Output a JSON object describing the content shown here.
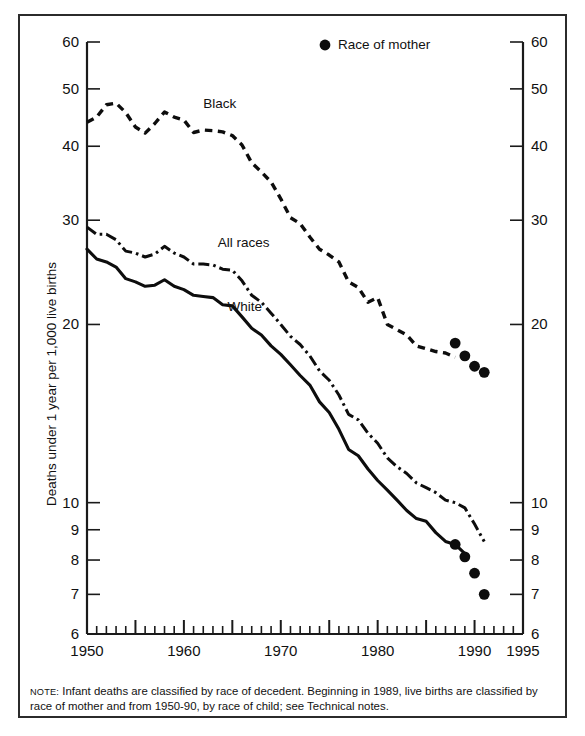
{
  "figure": {
    "note_label": "NOTE:",
    "note_text": "Infant deaths are classified by race of decedent. Beginning in 1989, live births are classified by race of mother and from 1950-90, by race of child; see Technical notes."
  },
  "legend": {
    "marker_label": "Race of mother"
  },
  "series_labels": {
    "black": "Black",
    "all_races": "All races",
    "white": "White"
  },
  "chart_data": {
    "type": "line",
    "title": "",
    "xlabel": "",
    "ylabel": "Deaths under 1 year per 1,000 live births",
    "yscale": "log",
    "ylim": [
      6,
      60
    ],
    "xlim": [
      1950,
      1995
    ],
    "grid": false,
    "legend_position": "top-center",
    "y_ticks": [
      6,
      7,
      8,
      9,
      10,
      20,
      30,
      40,
      50,
      60
    ],
    "y_tick_labels": [
      "6",
      "7",
      "8",
      "9",
      "10",
      "20",
      "30",
      "40",
      "50",
      "60"
    ],
    "x_ticks_major": [
      1950,
      1955,
      1960,
      1965,
      1970,
      1975,
      1980,
      1985,
      1990,
      1995
    ],
    "x_tick_labels": [
      {
        "x": 1950,
        "label": "1950"
      },
      {
        "x": 1960,
        "label": "1960"
      },
      {
        "x": 1970,
        "label": "1970"
      },
      {
        "x": 1980,
        "label": "1980"
      },
      {
        "x": 1990,
        "label": "1990"
      },
      {
        "x": 1995,
        "label": "1995"
      }
    ],
    "x_tick_minor_step": 1,
    "series": [
      {
        "name": "Black",
        "style": "dashed",
        "label_at": {
          "x": 1962.0,
          "y": 46.5
        },
        "x": [
          1950,
          1951,
          1952,
          1953,
          1954,
          1955,
          1956,
          1957,
          1958,
          1959,
          1960,
          1961,
          1962,
          1963,
          1964,
          1965,
          1966,
          1967,
          1968,
          1969,
          1970,
          1971,
          1972,
          1973,
          1974,
          1975,
          1976,
          1977,
          1978,
          1979,
          1980,
          1981,
          1982,
          1983,
          1984,
          1985,
          1986,
          1987,
          1988
        ],
        "values": [
          43.9,
          44.8,
          47.0,
          47.3,
          45.6,
          43.1,
          42.1,
          43.7,
          45.7,
          44.8,
          44.3,
          42.2,
          42.6,
          42.5,
          42.3,
          41.7,
          40.2,
          37.5,
          36.2,
          34.8,
          32.6,
          30.3,
          29.6,
          28.1,
          26.8,
          26.2,
          25.5,
          23.6,
          23.1,
          21.8,
          22.2,
          20.0,
          19.6,
          19.2,
          18.4,
          18.2,
          18.0,
          17.9,
          17.6
        ]
      },
      {
        "name": "All races",
        "style": "dash-dot",
        "label_at": {
          "x": 1963.5,
          "y": 27.0
        },
        "x": [
          1950,
          1951,
          1952,
          1953,
          1954,
          1955,
          1956,
          1957,
          1958,
          1959,
          1960,
          1961,
          1962,
          1963,
          1964,
          1965,
          1966,
          1967,
          1968,
          1969,
          1970,
          1971,
          1972,
          1973,
          1974,
          1975,
          1976,
          1977,
          1978,
          1979,
          1980,
          1981,
          1982,
          1983,
          1984,
          1985,
          1986,
          1987,
          1988,
          1989,
          1990,
          1991
        ],
        "values": [
          29.2,
          28.4,
          28.4,
          27.8,
          26.6,
          26.4,
          26.0,
          26.3,
          27.1,
          26.4,
          26.0,
          25.3,
          25.3,
          25.2,
          24.8,
          24.7,
          23.7,
          22.4,
          21.8,
          20.9,
          20.0,
          19.1,
          18.5,
          17.7,
          16.7,
          16.1,
          15.2,
          14.1,
          13.8,
          13.1,
          12.6,
          11.9,
          11.5,
          11.2,
          10.8,
          10.6,
          10.4,
          10.1,
          10.0,
          9.8,
          9.2,
          8.6
        ]
      },
      {
        "name": "White",
        "style": "solid",
        "label_at": {
          "x": 1964.5,
          "y": 21.1
        },
        "x": [
          1950,
          1951,
          1952,
          1953,
          1954,
          1955,
          1956,
          1957,
          1958,
          1959,
          1960,
          1961,
          1962,
          1963,
          1964,
          1965,
          1966,
          1967,
          1968,
          1969,
          1970,
          1971,
          1972,
          1973,
          1974,
          1975,
          1976,
          1977,
          1978,
          1979,
          1980,
          1981,
          1982,
          1983,
          1984,
          1985,
          1986,
          1987,
          1988,
          1989
        ],
        "values": [
          26.8,
          25.8,
          25.5,
          25.0,
          23.9,
          23.6,
          23.2,
          23.3,
          23.8,
          23.2,
          22.9,
          22.4,
          22.3,
          22.2,
          21.6,
          21.5,
          20.6,
          19.7,
          19.2,
          18.4,
          17.8,
          17.1,
          16.4,
          15.8,
          14.8,
          14.2,
          13.3,
          12.3,
          12.0,
          11.4,
          10.9,
          10.5,
          10.1,
          9.7,
          9.4,
          9.3,
          8.9,
          8.6,
          8.5,
          8.2
        ]
      }
    ],
    "marker_points": [
      {
        "series": "Black",
        "x": 1988,
        "y": 18.6
      },
      {
        "series": "Black",
        "x": 1989,
        "y": 17.7
      },
      {
        "series": "Black",
        "x": 1990,
        "y": 17.0
      },
      {
        "series": "Black",
        "x": 1991,
        "y": 16.6
      },
      {
        "series": "White",
        "x": 1988,
        "y": 8.5
      },
      {
        "series": "White",
        "x": 1989,
        "y": 8.1
      },
      {
        "series": "White",
        "x": 1990,
        "y": 7.6
      },
      {
        "series": "White",
        "x": 1991,
        "y": 7.0
      }
    ]
  }
}
